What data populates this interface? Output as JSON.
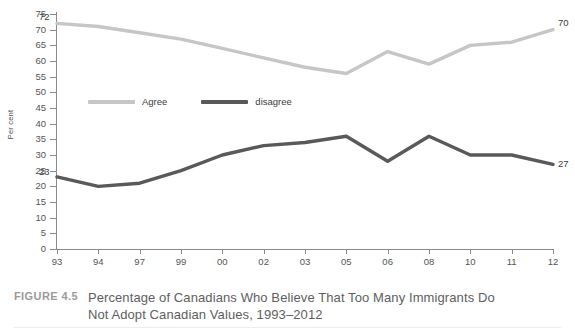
{
  "figure": {
    "number_label": "FIGURE 4.5",
    "caption": "Percentage of Canadians Who Believe That Too Many Immigrants Do Not Adopt Canadian Values, 1993–2012"
  },
  "axes": {
    "ylabel": "Per cent",
    "yticks": [
      "0",
      "5",
      "10",
      "15",
      "20",
      "25",
      "30",
      "35",
      "40",
      "45",
      "50",
      "55",
      "60",
      "65",
      "70",
      "75"
    ],
    "xticks": [
      "93",
      "94",
      "97",
      "99",
      "00",
      "02",
      "03",
      "05",
      "06",
      "08",
      "10",
      "11",
      "12"
    ]
  },
  "legend": {
    "items": [
      {
        "label": "Agree",
        "color": "#c6c6c6"
      },
      {
        "label": "disagree",
        "color": "#595959"
      }
    ]
  },
  "annotations": {
    "agree_start": "72",
    "agree_end": "70",
    "disagree_start": "23",
    "disagree_end": "27"
  },
  "chart_data": {
    "type": "line",
    "title": "Percentage of Canadians Who Believe That Too Many Immigrants Do Not Adopt Canadian Values, 1993–2012",
    "xlabel": "",
    "ylabel": "Per cent",
    "categories": [
      "93",
      "94",
      "97",
      "99",
      "00",
      "02",
      "03",
      "05",
      "06",
      "08",
      "10",
      "11",
      "12"
    ],
    "ylim": [
      0,
      75
    ],
    "ytick_step": 5,
    "grid": false,
    "legend_position": "inside-upper-left",
    "series": [
      {
        "name": "Agree",
        "color": "#c6c6c6",
        "values": [
          72,
          71,
          69,
          67,
          64,
          61,
          58,
          56,
          63,
          59,
          65,
          66,
          70
        ]
      },
      {
        "name": "disagree",
        "color": "#595959",
        "values": [
          23,
          20,
          21,
          25,
          30,
          33,
          34,
          36,
          28,
          36,
          30,
          30,
          27
        ]
      }
    ]
  }
}
